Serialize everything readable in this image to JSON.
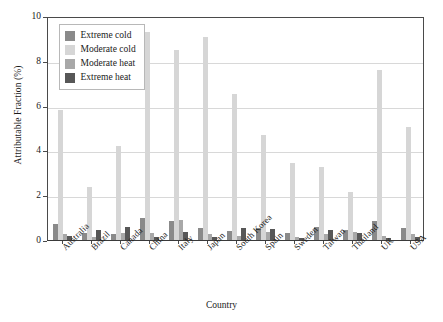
{
  "chart_data": {
    "type": "bar",
    "title": "",
    "xlabel": "Country",
    "ylabel": "Attributable Fraction (%)",
    "ylim": [
      0,
      10
    ],
    "yticks": [
      0,
      2,
      4,
      6,
      8,
      10
    ],
    "grid": true,
    "legend_position": "top-left",
    "categories": [
      "Australia",
      "Brazil",
      "Canada",
      "China",
      "Italy",
      "Japan",
      "South Korea",
      "Spain",
      "Sweden",
      "Taiwan",
      "Thailand",
      "UK",
      "USA"
    ],
    "series": [
      {
        "name": "Extreme cold",
        "color": "#8a8a8a",
        "values": [
          0.7,
          0.3,
          0.25,
          1.0,
          0.85,
          0.55,
          0.4,
          0.55,
          0.3,
          0.6,
          0.45,
          0.85,
          0.55
        ]
      },
      {
        "name": "Moderate cold",
        "color": "#d6d6d6",
        "values": [
          5.8,
          2.35,
          4.2,
          9.3,
          8.5,
          9.05,
          6.5,
          4.7,
          3.45,
          3.25,
          2.15,
          7.6,
          5.05
        ]
      },
      {
        "name": "Moderate heat",
        "color": "#a8a8a8",
        "values": [
          0.25,
          0.15,
          0.3,
          0.3,
          0.9,
          0.25,
          0.2,
          0.35,
          0.15,
          0.25,
          0.35,
          0.2,
          0.25
        ]
      },
      {
        "name": "Extreme heat",
        "color": "#575757",
        "values": [
          0.2,
          0.45,
          0.6,
          0.15,
          0.35,
          0.15,
          0.55,
          0.5,
          0.1,
          0.45,
          0.3,
          0.1,
          0.15
        ]
      }
    ]
  },
  "legend": {
    "items": [
      {
        "label": "Extreme cold",
        "color": "#8a8a8a"
      },
      {
        "label": "Moderate cold",
        "color": "#d6d6d6"
      },
      {
        "label": "Moderate heat",
        "color": "#a8a8a8"
      },
      {
        "label": "Extreme heat",
        "color": "#575757"
      }
    ]
  },
  "axes": {
    "y_title": "Attributable Fraction (%)",
    "x_title": "Country"
  }
}
